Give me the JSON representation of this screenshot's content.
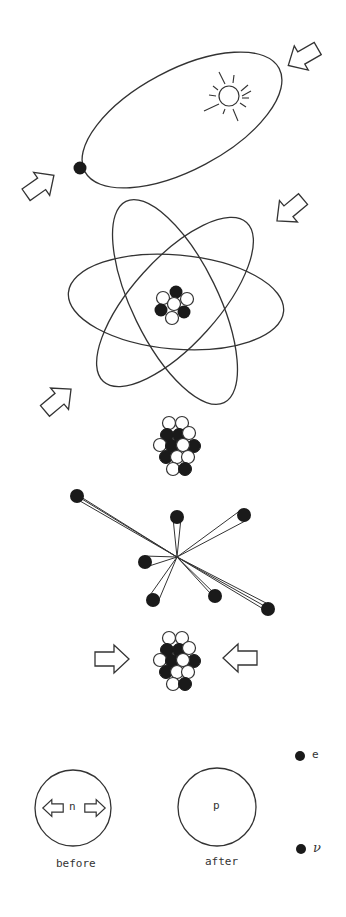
{
  "diagram": {
    "panels": [
      {
        "id": "solar-orbit",
        "description": "planet orbiting sun on an elliptical orbit, with two inward arrows"
      },
      {
        "id": "atom",
        "description": "atom with three electron orbits around a small nucleus, with two inward arrows"
      },
      {
        "id": "nucleus",
        "description": "cluster of protons and neutrons"
      },
      {
        "id": "fission",
        "description": "particles flying apart from a central point with motion trails"
      },
      {
        "id": "fusion",
        "description": "nucleus squeezed by two horizontal arrows"
      },
      {
        "id": "beta-decay",
        "description": "neutron decays into proton, electron and neutrino"
      }
    ],
    "beta_decay": {
      "before_particle": "n",
      "before_label": "before",
      "after_particle": "p",
      "after_label": "after",
      "emitted": [
        {
          "symbol": "e"
        },
        {
          "symbol": "ν"
        }
      ]
    },
    "colors": {
      "ink": "#222222",
      "fill_dark": "#1a1a1a",
      "background": "#ffffff"
    }
  }
}
